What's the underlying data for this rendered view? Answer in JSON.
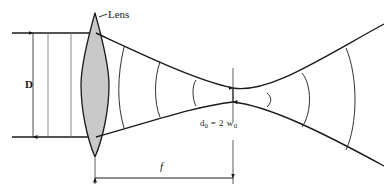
{
  "figure": {
    "domain": "Diagram",
    "kind": "optics-ray-diagram",
    "background_color": "#ffffff",
    "line_color": "#1a1a1a",
    "lens_fill_color": "#c9c9c9",
    "lens_stroke_color": "#1a1a1a",
    "dimension_line_color": "#4a4a4a"
  },
  "labels": {
    "lens": "Lens",
    "aperture_diameter": "D",
    "focal_length": "f",
    "waist_prefix": "d",
    "waist_sub1": "0",
    "waist_equals": " = 2 w",
    "waist_sub2": "0",
    "waist_full": "d0 = 2 w0"
  },
  "geometry": {
    "canvas_width": 387,
    "canvas_height": 196,
    "optical_axis_y": 95,
    "lens": {
      "center_x": 95,
      "top_apex_y": 13,
      "bottom_apex_y": 157,
      "half_width": 14
    },
    "input_beam": {
      "top_ray_y": 33,
      "bottom_ray_y": 137,
      "start_x": 12,
      "end_x": 95
    },
    "waist": {
      "x": 233,
      "half_height": 7
    },
    "dimension_D": {
      "x": 33,
      "y_top": 33,
      "y_bottom": 137
    },
    "dimension_f": {
      "y": 178,
      "x_start": 95,
      "x_end": 233
    },
    "wavefronts_converging": 3,
    "wavefronts_diverging": 3
  }
}
